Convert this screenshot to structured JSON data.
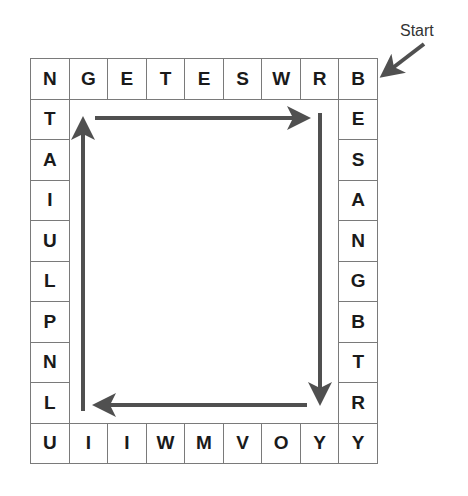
{
  "puzzle": {
    "start_label": "Start",
    "columns": 9,
    "rows": 10,
    "top_row": [
      "N",
      "G",
      "E",
      "T",
      "E",
      "S",
      "W",
      "R",
      "B"
    ],
    "right_column": [
      "B",
      "E",
      "S",
      "A",
      "N",
      "G",
      "B",
      "T",
      "R",
      "Y"
    ],
    "bottom_row": [
      "U",
      "I",
      "I",
      "W",
      "M",
      "V",
      "O",
      "Y",
      "Y"
    ],
    "left_column": [
      "N",
      "T",
      "A",
      "I",
      "U",
      "L",
      "P",
      "N",
      "L",
      "U"
    ],
    "arrows": [
      {
        "direction": "right",
        "from": [
          95,
          118
        ],
        "to": [
          303,
          118
        ]
      },
      {
        "direction": "down",
        "from": [
          320,
          113
        ],
        "to": [
          320,
          398
        ]
      },
      {
        "direction": "left",
        "from": [
          307,
          405
        ],
        "to": [
          100,
          405
        ]
      },
      {
        "direction": "up",
        "from": [
          83,
          411
        ],
        "to": [
          83,
          124
        ]
      }
    ],
    "colors": {
      "arrow": "#505050",
      "grid_line": "#7a7a7a",
      "letter": "#1a1a1a"
    }
  }
}
